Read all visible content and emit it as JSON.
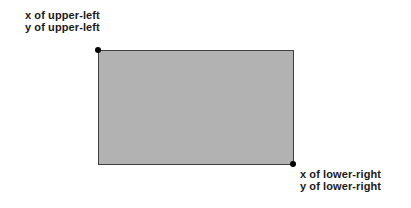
{
  "diagram": {
    "upper_left_label": {
      "line1": "x of upper-left",
      "line2": "y of upper-left"
    },
    "lower_right_label": {
      "line1": "x of lower-right",
      "line2": "y of lower-right"
    },
    "points": [
      {
        "name": "upper-left",
        "corner": "top-left of rectangle"
      },
      {
        "name": "lower-right",
        "corner": "bottom-right of rectangle"
      }
    ],
    "colors": {
      "background": "#ffffff",
      "rect_fill": "#b2b2b2",
      "rect_border": "#3f3f3f",
      "point": "#000000",
      "text": "#1a1a1a"
    }
  }
}
